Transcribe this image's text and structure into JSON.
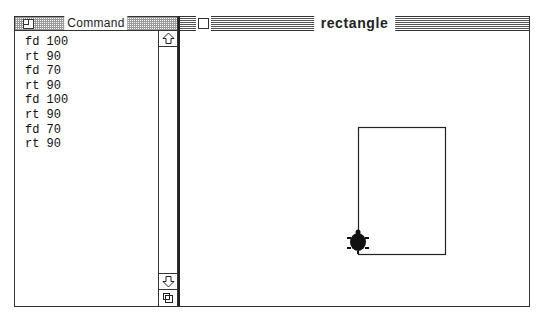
{
  "cropped_text": "?o?",
  "command_window": {
    "title": "Command",
    "lines": [
      "fd 100",
      "rt 90",
      "fd 70",
      "rt 90",
      "fd 100",
      "rt 90",
      "fd 70",
      "rt 90"
    ],
    "icons": {
      "close": "close-box-icon",
      "scroll_up": "arrow-up-icon",
      "scroll_down": "arrow-down-icon",
      "grow": "grow-box-icon"
    }
  },
  "graphics_window": {
    "title": "rectangle",
    "drawing": {
      "shape": "rectangle",
      "width_steps": 70,
      "height_steps": 100,
      "turtle": "turtle-icon",
      "line_color": "#222222"
    }
  }
}
